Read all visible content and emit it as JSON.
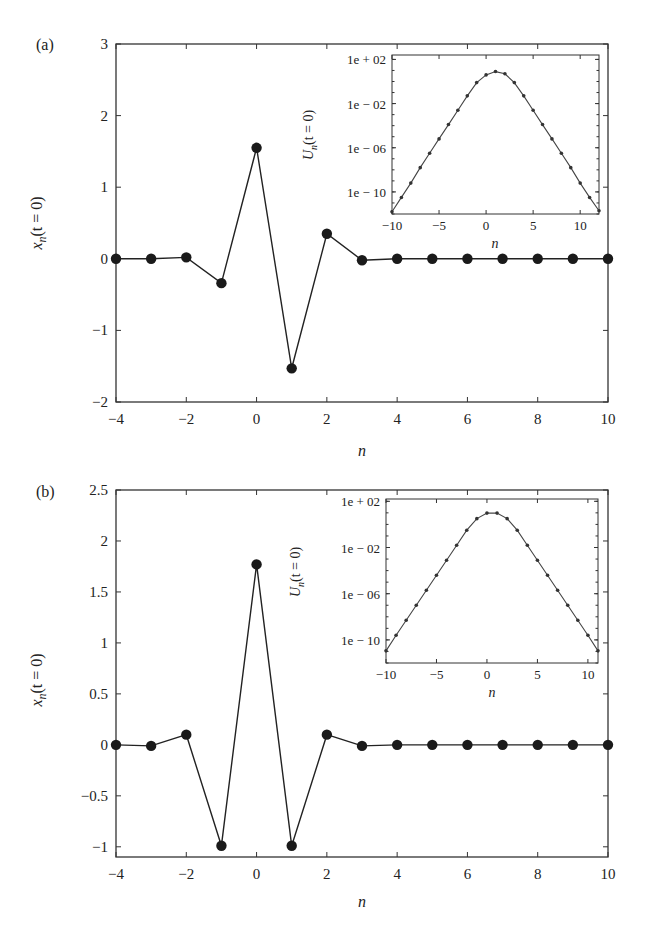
{
  "figure": {
    "panels": [
      {
        "label": "(a)",
        "xlabel": "n",
        "ylabel": "x_n(t = 0)",
        "ylabel_main": "x",
        "ylabel_sub": "n",
        "ylabel_rest": "(t = 0)",
        "inset": {
          "xlabel": "n",
          "ylabel_main": "U",
          "ylabel_sub": "n",
          "ylabel_rest": "(t = 0)"
        }
      },
      {
        "label": "(b)",
        "xlabel": "n",
        "ylabel": "x_n(t = 0)",
        "ylabel_main": "x",
        "ylabel_sub": "n",
        "ylabel_rest": "(t = 0)",
        "inset": {
          "xlabel": "n",
          "ylabel_main": "U",
          "ylabel_sub": "n",
          "ylabel_rest": "(t = 0)"
        }
      }
    ]
  },
  "chart_data": [
    {
      "id": "a-main",
      "type": "line",
      "panel_label": "(a)",
      "xlabel": "n",
      "ylabel": "x_n(t = 0)",
      "xlim": [
        -4,
        10
      ],
      "ylim": [
        -2,
        3
      ],
      "xticks": [
        -4,
        -2,
        0,
        2,
        4,
        6,
        8,
        10
      ],
      "yticks": [
        -2,
        -1,
        0,
        1,
        2,
        3
      ],
      "xtick_labels": [
        "−4",
        "−2",
        "0",
        "2",
        "4",
        "6",
        "8",
        "10"
      ],
      "ytick_labels": [
        "−2",
        "−1",
        "0",
        "1",
        "2",
        "3"
      ],
      "grid": false,
      "markers": "filled-circle",
      "x": [
        -4,
        -3,
        -2,
        -1,
        0,
        1,
        2,
        3,
        4,
        5,
        6,
        7,
        8,
        9,
        10
      ],
      "values": [
        0.0,
        0.0,
        0.02,
        -0.34,
        1.55,
        -1.53,
        0.35,
        -0.02,
        0.0,
        0.0,
        0.0,
        0.0,
        0.0,
        0.0,
        0.0
      ]
    },
    {
      "id": "a-inset",
      "type": "line",
      "panel_label": "(a) inset",
      "xlabel": "n",
      "ylabel": "U_n(t = 0)",
      "yscale": "log",
      "xlim": [
        -10,
        12
      ],
      "ylim_log10": [
        -12,
        2.4
      ],
      "xticks": [
        -10,
        -5,
        0,
        5,
        10
      ],
      "xtick_labels": [
        "−10",
        "−5",
        "0",
        "5",
        "10"
      ],
      "yticks_log10": [
        2,
        -2,
        -6,
        -10
      ],
      "ytick_labels": [
        "1e + 02",
        "1e − 02",
        "1e − 06",
        "1e − 10"
      ],
      "grid": false,
      "markers": "small-filled-circle",
      "x": [
        -10,
        -9,
        -8,
        -7,
        -6,
        -5,
        -4,
        -3,
        -2,
        -1,
        0,
        1,
        2,
        3,
        4,
        5,
        6,
        7,
        8,
        9,
        10,
        11,
        12
      ],
      "log10_values": [
        -11.8,
        -10.5,
        -9.2,
        -7.8,
        -6.5,
        -5.2,
        -3.9,
        -2.6,
        -1.3,
        -0.1,
        0.6,
        0.9,
        0.7,
        -0.1,
        -1.3,
        -2.6,
        -3.9,
        -5.2,
        -6.5,
        -7.8,
        -9.2,
        -10.5,
        -11.7
      ]
    },
    {
      "id": "b-main",
      "type": "line",
      "panel_label": "(b)",
      "xlabel": "n",
      "ylabel": "x_n(t = 0)",
      "xlim": [
        -4,
        10
      ],
      "ylim": [
        -1.1,
        2.5
      ],
      "xticks": [
        -4,
        -2,
        0,
        2,
        4,
        6,
        8,
        10
      ],
      "yticks": [
        -1,
        -0.5,
        0,
        0.5,
        1,
        1.5,
        2,
        2.5
      ],
      "xtick_labels": [
        "−4",
        "−2",
        "0",
        "2",
        "4",
        "6",
        "8",
        "10"
      ],
      "ytick_labels": [
        "−1",
        "−0.5",
        "0",
        "0.5",
        "1",
        "1.5",
        "2",
        "2.5"
      ],
      "grid": false,
      "markers": "filled-circle",
      "x": [
        -4,
        -3,
        -2,
        -1,
        0,
        1,
        2,
        3,
        4,
        5,
        6,
        7,
        8,
        9,
        10
      ],
      "values": [
        0.0,
        -0.01,
        0.1,
        -0.99,
        1.77,
        -0.99,
        0.1,
        -0.01,
        0.0,
        0.0,
        0.0,
        0.0,
        0.0,
        0.0,
        0.0
      ]
    },
    {
      "id": "b-inset",
      "type": "line",
      "panel_label": "(b) inset",
      "xlabel": "n",
      "ylabel": "U_n(t = 0)",
      "yscale": "log",
      "xlim": [
        -10,
        11
      ],
      "ylim_log10": [
        -12,
        2.2
      ],
      "xticks": [
        -10,
        -5,
        0,
        5,
        10
      ],
      "xtick_labels": [
        "−10",
        "−5",
        "0",
        "5",
        "10"
      ],
      "yticks_log10": [
        2,
        -2,
        -6,
        -10
      ],
      "ytick_labels": [
        "1e + 02",
        "1e − 02",
        "1e − 06",
        "1e − 10"
      ],
      "grid": false,
      "markers": "small-filled-circle",
      "x": [
        -10,
        -9,
        -8,
        -7,
        -6,
        -5,
        -4,
        -3,
        -2,
        -1,
        0,
        1,
        2,
        3,
        4,
        5,
        6,
        7,
        8,
        9,
        10,
        11
      ],
      "log10_values": [
        -10.95,
        -9.6,
        -8.3,
        -7.0,
        -5.7,
        -4.4,
        -3.1,
        -1.8,
        -0.5,
        0.5,
        0.98,
        0.98,
        0.5,
        -0.5,
        -1.8,
        -3.1,
        -4.4,
        -5.7,
        -7.0,
        -8.3,
        -9.6,
        -10.95
      ]
    }
  ]
}
